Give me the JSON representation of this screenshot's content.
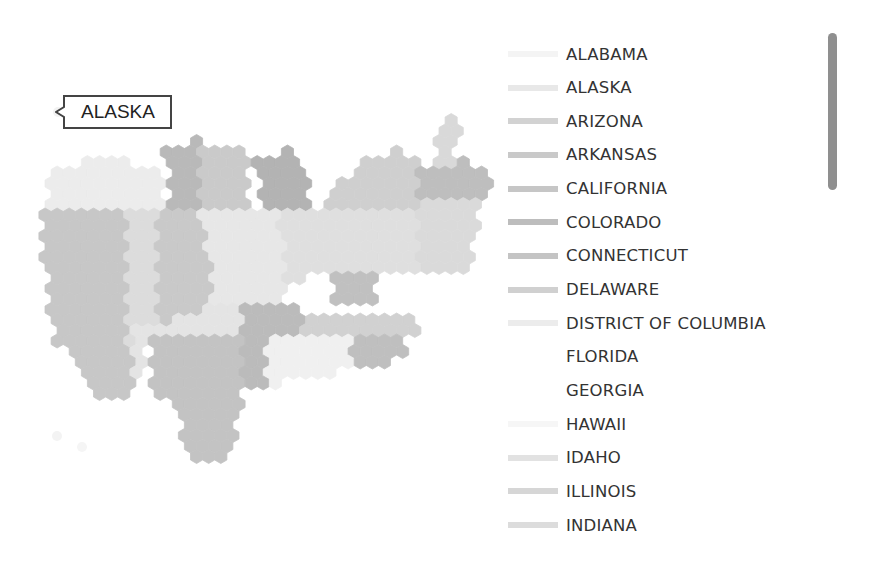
{
  "tooltip": {
    "label": "ALASKA"
  },
  "legend": {
    "items": [
      {
        "label": "ALABAMA",
        "color": "#f4f4f4"
      },
      {
        "label": "ALASKA",
        "color": "#e8e8e8"
      },
      {
        "label": "ARIZONA",
        "color": "#d2d2d2"
      },
      {
        "label": "ARKANSAS",
        "color": "#c9c9c9"
      },
      {
        "label": "CALIFORNIA",
        "color": "#c6c6c6"
      },
      {
        "label": "COLORADO",
        "color": "#bdbdbd"
      },
      {
        "label": "CONNECTICUT",
        "color": "#c4c4c4"
      },
      {
        "label": "DELAWARE",
        "color": "#d0d0d0"
      },
      {
        "label": "DISTRICT OF COLUMBIA",
        "color": "#ececec"
      },
      {
        "label": "FLORIDA",
        "color": "#ffffff"
      },
      {
        "label": "GEORGIA",
        "color": "#ffffff"
      },
      {
        "label": "HAWAII",
        "color": "#f6f6f6"
      },
      {
        "label": "IDAHO",
        "color": "#e2e2e2"
      },
      {
        "label": "ILLINOIS",
        "color": "#d6d6d6"
      },
      {
        "label": "INDIANA",
        "color": "#dcdcdc"
      }
    ]
  },
  "map": {
    "hex_size": 7,
    "regions": [
      {
        "name": "northwest-light",
        "color": "#ececec",
        "poly": [
          [
            50,
            172
          ],
          [
            95,
            160
          ],
          [
            165,
            165
          ],
          [
            165,
            205
          ],
          [
            50,
            205
          ]
        ]
      },
      {
        "name": "north-dark-a",
        "color": "#b9b9b9",
        "poly": [
          [
            165,
            150
          ],
          [
            205,
            138
          ],
          [
            215,
            150
          ],
          [
            200,
            205
          ],
          [
            170,
            205
          ]
        ]
      },
      {
        "name": "north-mid",
        "color": "#cacaca",
        "poly": [
          [
            200,
            150
          ],
          [
            245,
            150
          ],
          [
            250,
            205
          ],
          [
            200,
            205
          ]
        ]
      },
      {
        "name": "north-dark-b",
        "color": "#b3b3b3",
        "poly": [
          [
            255,
            160
          ],
          [
            290,
            150
          ],
          [
            310,
            180
          ],
          [
            305,
            215
          ],
          [
            260,
            210
          ]
        ]
      },
      {
        "name": "great-lakes",
        "color": "#cfcfcf",
        "poly": [
          [
            320,
            205
          ],
          [
            360,
            160
          ],
          [
            400,
            150
          ],
          [
            425,
            160
          ],
          [
            425,
            240
          ],
          [
            320,
            240
          ]
        ]
      },
      {
        "name": "new-england",
        "color": "#bebebe",
        "poly": [
          [
            420,
            165
          ],
          [
            470,
            160
          ],
          [
            492,
            178
          ],
          [
            480,
            200
          ],
          [
            420,
            200
          ]
        ]
      },
      {
        "name": "maine",
        "color": "#d9d9d9",
        "poly": [
          [
            430,
            165
          ],
          [
            445,
            115
          ],
          [
            460,
            125
          ],
          [
            455,
            165
          ]
        ]
      },
      {
        "name": "mid-atlantic",
        "color": "#dadada",
        "poly": [
          [
            420,
            200
          ],
          [
            480,
            200
          ],
          [
            470,
            270
          ],
          [
            420,
            270
          ]
        ]
      },
      {
        "name": "west-coast",
        "color": "#c7c7c7",
        "poly": [
          [
            45,
            205
          ],
          [
            125,
            205
          ],
          [
            130,
            300
          ],
          [
            130,
            400
          ],
          [
            100,
            395
          ],
          [
            55,
            340
          ],
          [
            45,
            270
          ]
        ]
      },
      {
        "name": "nevada",
        "color": "#dcdcdc",
        "poly": [
          [
            125,
            205
          ],
          [
            160,
            205
          ],
          [
            160,
            340
          ],
          [
            130,
            345
          ]
        ]
      },
      {
        "name": "mountain-mid",
        "color": "#c9c9c9",
        "poly": [
          [
            155,
            215
          ],
          [
            200,
            210
          ],
          [
            215,
            300
          ],
          [
            210,
            330
          ],
          [
            155,
            330
          ]
        ]
      },
      {
        "name": "center-light",
        "color": "#e7e7e7",
        "poly": [
          [
            200,
            205
          ],
          [
            280,
            205
          ],
          [
            285,
            300
          ],
          [
            215,
            305
          ]
        ]
      },
      {
        "name": "central-band",
        "color": "#dfdfdf",
        "poly": [
          [
            280,
            212
          ],
          [
            420,
            212
          ],
          [
            420,
            270
          ],
          [
            330,
            275
          ],
          [
            285,
            280
          ]
        ]
      },
      {
        "name": "south-mid-dark",
        "color": "#c0c0c0",
        "poly": [
          [
            330,
            270
          ],
          [
            370,
            268
          ],
          [
            380,
            300
          ],
          [
            335,
            300
          ]
        ]
      },
      {
        "name": "plains-light",
        "color": "#e4e4e4",
        "poly": [
          [
            130,
            330
          ],
          [
            245,
            300
          ],
          [
            245,
            330
          ],
          [
            150,
            335
          ],
          [
            135,
            395
          ]
        ]
      },
      {
        "name": "texas",
        "color": "#c3c3c3",
        "poly": [
          [
            150,
            335
          ],
          [
            245,
            330
          ],
          [
            245,
            395
          ],
          [
            235,
            440
          ],
          [
            220,
            465
          ],
          [
            190,
            462
          ],
          [
            180,
            420
          ],
          [
            150,
            380
          ]
        ]
      },
      {
        "name": "tennessee",
        "color": "#bbbbbb",
        "poly": [
          [
            240,
            300
          ],
          [
            300,
            300
          ],
          [
            300,
            330
          ],
          [
            275,
            340
          ],
          [
            270,
            385
          ],
          [
            240,
            385
          ]
        ]
      },
      {
        "name": "southeast-band",
        "color": "#d1d1d1",
        "poly": [
          [
            300,
            312
          ],
          [
            420,
            312
          ],
          [
            420,
            332
          ],
          [
            300,
            332
          ]
        ]
      },
      {
        "name": "georgia-dark",
        "color": "#bfbfbf",
        "poly": [
          [
            350,
            332
          ],
          [
            400,
            332
          ],
          [
            405,
            350
          ],
          [
            385,
            372
          ],
          [
            355,
            360
          ]
        ]
      },
      {
        "name": "south-light",
        "color": "#f0f0f0",
        "poly": [
          [
            270,
            332
          ],
          [
            350,
            332
          ],
          [
            355,
            370
          ],
          [
            290,
            382
          ],
          [
            265,
            385
          ]
        ]
      }
    ]
  }
}
